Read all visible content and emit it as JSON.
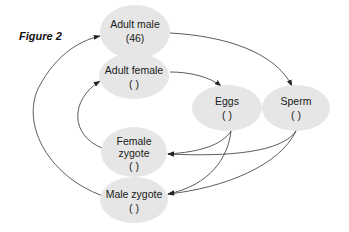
{
  "figure_label": "Figure 2",
  "colors": {
    "node_fill": "#e6e6e6",
    "edge": "#333333",
    "text": "#1a1a1a"
  },
  "nodes": [
    {
      "id": "adult-male",
      "lines": [
        "Adult male",
        "(46)"
      ]
    },
    {
      "id": "adult-female",
      "lines": [
        "Adult female",
        "(   )"
      ]
    },
    {
      "id": "eggs",
      "lines": [
        "Eggs",
        "(   )"
      ]
    },
    {
      "id": "sperm",
      "lines": [
        "Sperm",
        "(   )"
      ]
    },
    {
      "id": "female-zygote",
      "lines": [
        "Female",
        "zygote",
        "(   )"
      ]
    },
    {
      "id": "male-zygote",
      "lines": [
        "Male zygote",
        "(   )"
      ]
    }
  ],
  "edges": [
    {
      "from": "adult-male",
      "to": "sperm"
    },
    {
      "from": "adult-female",
      "to": "eggs"
    },
    {
      "from": "eggs",
      "to": "female-zygote"
    },
    {
      "from": "eggs",
      "to": "male-zygote"
    },
    {
      "from": "sperm",
      "to": "female-zygote"
    },
    {
      "from": "sperm",
      "to": "male-zygote"
    },
    {
      "from": "female-zygote",
      "to": "adult-female"
    },
    {
      "from": "male-zygote",
      "to": "adult-male"
    }
  ]
}
